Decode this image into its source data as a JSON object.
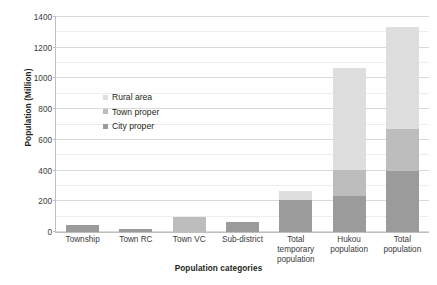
{
  "chart_data": {
    "type": "bar",
    "title": "",
    "subtitle": "",
    "xlabel": "Population categories",
    "ylabel": "Population (Million)",
    "ylim": [
      0,
      1400
    ],
    "ytick_labels": [
      "0",
      "200",
      "400",
      "600",
      "800",
      "1000",
      "1200",
      "1400"
    ],
    "ytick_values": [
      0,
      200,
      400,
      600,
      800,
      1000,
      1200,
      1400
    ],
    "ytick_interval": 200,
    "minor_gridline_interval": 100,
    "grid": true,
    "grid_axis": "y",
    "stacked": true,
    "legend_position": "inside-center-left",
    "categories": [
      "Township",
      "Town RC",
      "Town VC",
      "Sub-district",
      "Total temporary population",
      "Hukou population",
      "Total population"
    ],
    "category_label_lines": [
      [
        "Township"
      ],
      [
        "Town RC"
      ],
      [
        "Town VC"
      ],
      [
        "Sub-district"
      ],
      [
        "Total",
        "temporary",
        "population"
      ],
      [
        "Hukou",
        "population"
      ],
      [
        "Total",
        "population"
      ]
    ],
    "series": [
      {
        "name": "City proper",
        "color": "#9b9b9b",
        "values": [
          48,
          20,
          0,
          62,
          210,
          232,
          400
        ]
      },
      {
        "name": "Town proper",
        "color": "#bdbdbd",
        "values": [
          0,
          0,
          95,
          0,
          0,
          170,
          270
        ]
      },
      {
        "name": "Rural area",
        "color": "#dedede",
        "values": [
          0,
          0,
          0,
          0,
          55,
          668,
          665
        ]
      }
    ],
    "totals": [
      48,
      20,
      95,
      62,
      265,
      1070,
      1335
    ],
    "legend_entries": [
      {
        "label": "Rural area",
        "color": "#dedede"
      },
      {
        "label": "Town proper",
        "color": "#bdbdbd"
      },
      {
        "label": "City proper",
        "color": "#9b9b9b"
      }
    ]
  }
}
